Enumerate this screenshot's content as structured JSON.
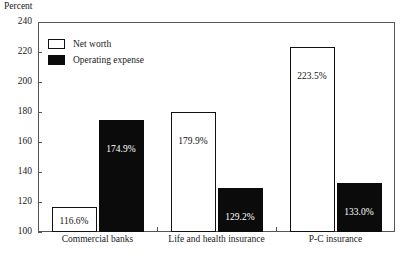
{
  "chart_data": {
    "type": "bar",
    "title": "",
    "xlabel": "",
    "ylabel": "Percent",
    "ylim": [
      100,
      240
    ],
    "ytick_step": 20,
    "ytick_labels": [
      "240",
      "220",
      "200",
      "180",
      "160",
      "140",
      "120",
      "100"
    ],
    "grid": false,
    "legend_position": "top-left",
    "categories": [
      "Commercial banks",
      "Life and health insurance",
      "P-C insurance"
    ],
    "series": [
      {
        "name": "Net worth",
        "color": "#ffffff",
        "border_color": "#111111",
        "values": [
          116.6,
          179.9,
          223.5
        ],
        "labels": [
          "116.6%",
          "179.9%",
          "223.5%"
        ]
      },
      {
        "name": "Operating expense",
        "color": "#0b0b0b",
        "border_color": "#0b0b0b",
        "values": [
          174.9,
          129.2,
          133.0
        ],
        "labels": [
          "174.9%",
          "129.2%",
          "133.0%"
        ]
      }
    ]
  },
  "axis": {
    "y_title": "Percent"
  },
  "legend": {
    "items": [
      {
        "label": "Net worth",
        "swatch": "white-square-outline"
      },
      {
        "label": "Operating expense",
        "swatch": "black-filled-square"
      }
    ]
  }
}
